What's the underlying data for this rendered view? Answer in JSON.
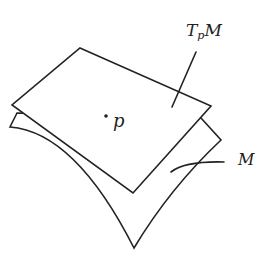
{
  "figure": {
    "labels": {
      "tangent_plane_main": "T",
      "tangent_plane_sub": "p",
      "tangent_plane_tail": "M",
      "point": "p",
      "manifold": "M"
    },
    "colors": {
      "line": "#222222",
      "background": "#ffffff"
    }
  }
}
